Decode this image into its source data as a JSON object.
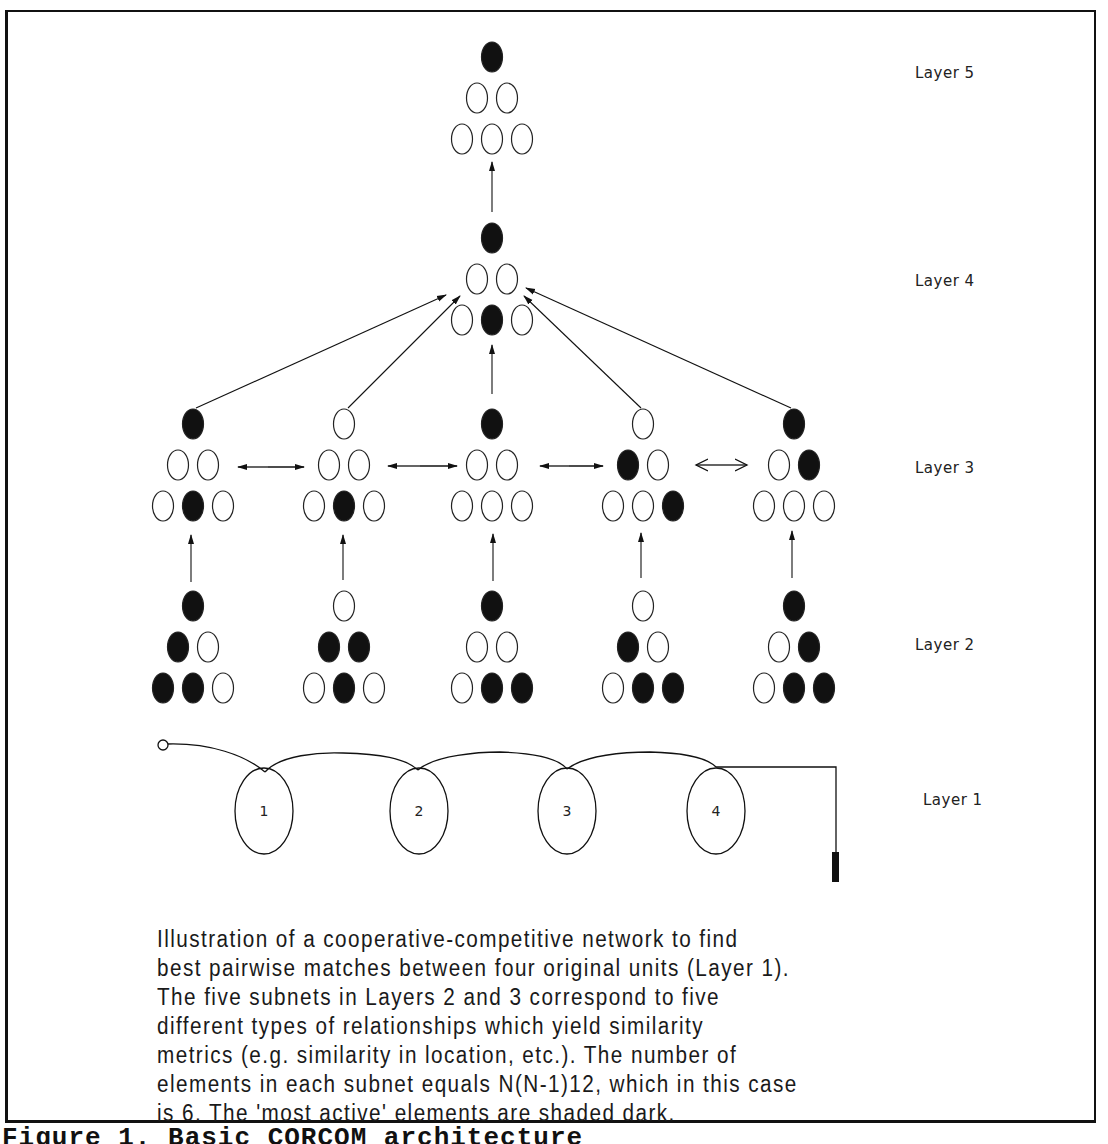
{
  "figure": {
    "title": "Figure 1.  Basic CORCOM architecture",
    "caption": "Illustration of a cooperative-competitive network to find\nbest pairwise matches between four original units (Layer 1).\nThe five subnets in Layers 2 and 3 correspond to five\ndifferent types of relationships which yield similarity\nmetrics (e.g. similarity in location, etc.).  The number of\nelements in each subnet equals N(N-1)12, which in this case\nis 6.  The 'most active' elements are shaded dark."
  },
  "layers": [
    {
      "id": "layer5",
      "label": "Layer 5"
    },
    {
      "id": "layer4",
      "label": "Layer 4"
    },
    {
      "id": "layer3",
      "label": "Layer 3"
    },
    {
      "id": "layer2",
      "label": "Layer 2"
    },
    {
      "id": "layer1",
      "label": "Layer 1"
    }
  ],
  "networks": {
    "element_order": "top, row2-left, row2-right, row3-left, row3-middle, row3-right",
    "layer5": [
      [
        1,
        0,
        0,
        0,
        0,
        0
      ]
    ],
    "layer4": [
      [
        1,
        0,
        0,
        0,
        1,
        0
      ]
    ],
    "layer3": [
      [
        1,
        0,
        0,
        0,
        1,
        0
      ],
      [
        0,
        0,
        0,
        0,
        1,
        0
      ],
      [
        1,
        0,
        0,
        0,
        0,
        0
      ],
      [
        0,
        1,
        0,
        0,
        0,
        1
      ],
      [
        1,
        0,
        1,
        0,
        0,
        0
      ]
    ],
    "layer2": [
      [
        1,
        1,
        0,
        1,
        1,
        0
      ],
      [
        0,
        1,
        1,
        0,
        1,
        0
      ],
      [
        1,
        0,
        0,
        0,
        1,
        1
      ],
      [
        0,
        1,
        0,
        0,
        1,
        1
      ],
      [
        1,
        0,
        1,
        0,
        1,
        1
      ]
    ]
  },
  "layer1_units": [
    "1",
    "2",
    "3",
    "4"
  ],
  "colors": {
    "ink": "#111111",
    "background": "#ffffff"
  }
}
